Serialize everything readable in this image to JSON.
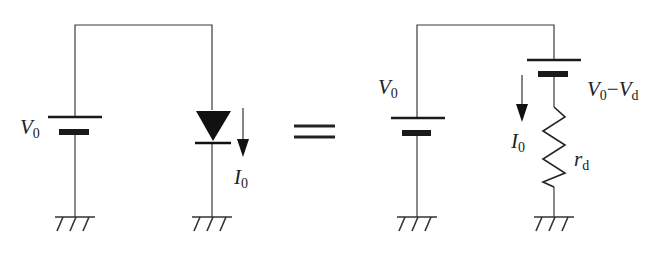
{
  "diagram": {
    "left_circuit": {
      "source_label": {
        "main": "V",
        "sub": "0"
      },
      "current_label": {
        "main": "I",
        "sub": "0"
      },
      "element": "diode"
    },
    "equals_sign": "=",
    "right_circuit": {
      "source_label": {
        "main": "V",
        "sub": "0"
      },
      "series_battery_label": {
        "v1": "V",
        "s1": "0",
        "minus": "−",
        "v2": "V",
        "s2": "d"
      },
      "current_label": {
        "main": "I",
        "sub": "0"
      },
      "resistor_label": {
        "main": "r",
        "sub": "d"
      },
      "element": "battery + resistor"
    }
  }
}
